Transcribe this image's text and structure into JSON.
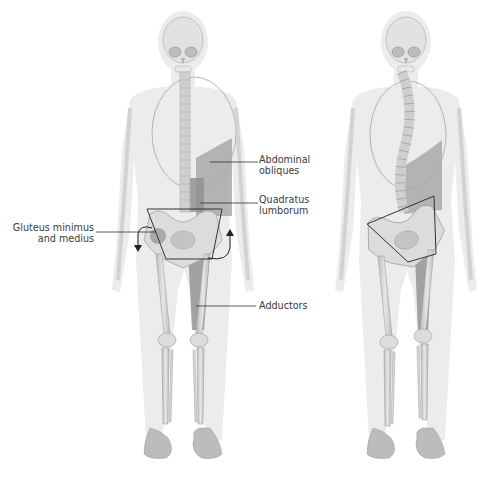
{
  "diagram": {
    "type": "anatomical-illustration",
    "figures": [
      {
        "id": "left",
        "description": "Front view skeleton within body silhouette, level pelvis, straight spine, muscles highlighted"
      },
      {
        "id": "right",
        "description": "Front view skeleton with tilted pelvis and curved spine (lateral imbalance)"
      }
    ],
    "labels": {
      "abdominal_obliques": {
        "line1": "Abdominal",
        "line2": "obliques"
      },
      "quadratus_lumborum": {
        "line1": "Quadratus",
        "line2": "lumborum"
      },
      "gluteus": {
        "line1": "Gluteus minimus",
        "line2": "and medius"
      },
      "adductors": {
        "line1": "Adductors"
      }
    },
    "colors": {
      "background": "#ffffff",
      "body_silhouette": "#ececec",
      "bone": "#d6d6d6",
      "bone_outline": "#9a9a9a",
      "muscle_highlight": "#9c9c9c",
      "muscle_dark": "#8a8a8a",
      "leader_line": "#333333",
      "label_text": "#3a3a3a"
    }
  }
}
